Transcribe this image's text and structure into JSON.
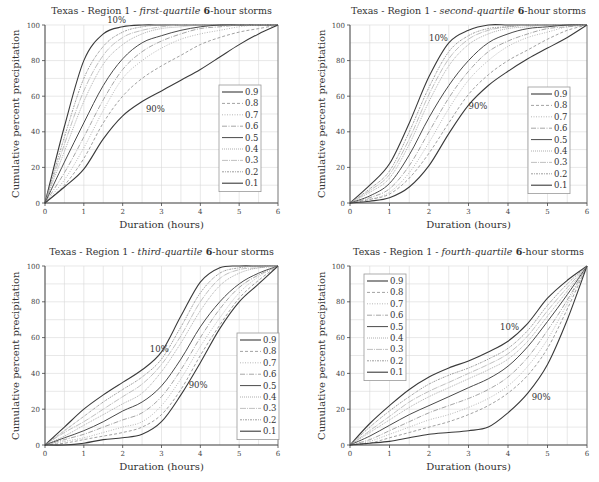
{
  "chart_data": [
    {
      "type": "line",
      "title_prefix": "Texas - Region 1 - ",
      "title_italic": "first-quartile",
      "title_bold": " 6",
      "title_suffix": "-hour storms",
      "xlabel": "Duration (hours)",
      "ylabel": "Cumulative percent precipitation",
      "xlim": [
        0,
        6
      ],
      "ylim": [
        0,
        100
      ],
      "xticks": [
        0,
        1,
        2,
        3,
        4,
        5,
        6
      ],
      "yticks": [
        0,
        20,
        40,
        60,
        80,
        100
      ],
      "grid": true,
      "legend_position": "right-middle",
      "legend": [
        "0.9",
        "0.8",
        "0.7",
        "0.6",
        "0.5",
        "0.4",
        "0.3",
        "0.2",
        "0.1"
      ],
      "annotations": [
        {
          "text": "10%",
          "x": 1.6,
          "y": 101
        },
        {
          "text": "90%",
          "x": 2.6,
          "y": 51
        }
      ],
      "x": [
        0,
        0.5,
        1,
        1.5,
        2,
        2.5,
        3,
        3.5,
        4,
        4.5,
        5,
        5.5,
        6
      ],
      "series": [
        {
          "name": "0.1",
          "values": [
            0,
            43,
            80,
            95,
            99,
            100,
            100,
            100,
            100,
            100,
            100,
            100,
            100
          ]
        },
        {
          "name": "0.2",
          "values": [
            0,
            37,
            70,
            88,
            96,
            99,
            100,
            100,
            100,
            100,
            100,
            100,
            100
          ]
        },
        {
          "name": "0.3",
          "values": [
            0,
            33,
            63,
            83,
            93,
            97,
            99,
            100,
            100,
            100,
            100,
            100,
            100
          ]
        },
        {
          "name": "0.4",
          "values": [
            0,
            29,
            57,
            78,
            89,
            95,
            98,
            99,
            100,
            100,
            100,
            100,
            100
          ]
        },
        {
          "name": "0.5",
          "values": [
            0,
            23,
            45,
            66,
            81,
            90,
            94,
            97,
            99,
            100,
            100,
            100,
            100
          ]
        },
        {
          "name": "0.6",
          "values": [
            0,
            17,
            37,
            58,
            75,
            85,
            91,
            95,
            98,
            99,
            100,
            100,
            100
          ]
        },
        {
          "name": "0.7",
          "values": [
            0,
            13,
            31,
            52,
            70,
            80,
            87,
            92,
            95,
            97,
            99,
            100,
            100
          ]
        },
        {
          "name": "0.8",
          "values": [
            0,
            10,
            25,
            45,
            60,
            70,
            77,
            83,
            89,
            93,
            96,
            98,
            100
          ]
        },
        {
          "name": "0.9",
          "values": [
            0,
            9,
            19,
            36,
            49,
            57,
            63,
            69,
            75,
            82,
            89,
            95,
            100
          ]
        }
      ]
    },
    {
      "type": "line",
      "title_prefix": "Texas - Region 1 - ",
      "title_italic": "second-quartile",
      "title_bold": " 6",
      "title_suffix": "-hour storms",
      "xlabel": "Duration (hours)",
      "ylabel": "Cumulative percent precipitation",
      "xlim": [
        0,
        6
      ],
      "ylim": [
        0,
        100
      ],
      "xticks": [
        0,
        1,
        2,
        3,
        4,
        5,
        6
      ],
      "yticks": [
        0,
        20,
        40,
        60,
        80,
        100
      ],
      "grid": true,
      "legend_position": "right-middle",
      "legend": [
        "0.9",
        "0.8",
        "0.7",
        "0.6",
        "0.5",
        "0.4",
        "0.3",
        "0.2",
        "0.1"
      ],
      "annotations": [
        {
          "text": "10%",
          "x": 2.0,
          "y": 91
        },
        {
          "text": "90%",
          "x": 3.0,
          "y": 53
        }
      ],
      "x": [
        0,
        0.5,
        1,
        1.5,
        2,
        2.5,
        3,
        3.5,
        4,
        4.5,
        5,
        5.5,
        6
      ],
      "series": [
        {
          "name": "0.1",
          "values": [
            0,
            10,
            22,
            45,
            71,
            90,
            97,
            100,
            100,
            100,
            100,
            100,
            100
          ]
        },
        {
          "name": "0.2",
          "values": [
            0,
            8,
            18,
            40,
            65,
            85,
            94,
            98,
            99,
            100,
            100,
            100,
            100
          ]
        },
        {
          "name": "0.3",
          "values": [
            0,
            7,
            16,
            36,
            61,
            81,
            92,
            97,
            99,
            100,
            100,
            100,
            100
          ]
        },
        {
          "name": "0.4",
          "values": [
            0,
            6,
            14,
            33,
            57,
            77,
            89,
            95,
            98,
            99,
            100,
            100,
            100
          ]
        },
        {
          "name": "0.5",
          "values": [
            0,
            4,
            11,
            27,
            48,
            66,
            80,
            90,
            95,
            98,
            99,
            100,
            100
          ]
        },
        {
          "name": "0.6",
          "values": [
            0,
            3,
            8,
            21,
            40,
            59,
            74,
            85,
            91,
            95,
            98,
            99,
            100
          ]
        },
        {
          "name": "0.7",
          "values": [
            0,
            2,
            6,
            17,
            34,
            53,
            69,
            80,
            88,
            93,
            96,
            99,
            100
          ]
        },
        {
          "name": "0.8",
          "values": [
            0,
            2,
            5,
            14,
            28,
            45,
            61,
            72,
            80,
            86,
            92,
            97,
            100
          ]
        },
        {
          "name": "0.9",
          "values": [
            0,
            1,
            3,
            9,
            21,
            39,
            55,
            66,
            74,
            81,
            87,
            93,
            100
          ]
        }
      ]
    },
    {
      "type": "line",
      "title_prefix": "Texas - Region 1 - ",
      "title_italic": "third-quartile",
      "title_bold": " 6",
      "title_suffix": "-hour storms",
      "xlabel": "Duration (hours)",
      "ylabel": "Cumulative percent precipitation",
      "xlim": [
        0,
        6
      ],
      "ylim": [
        0,
        100
      ],
      "xticks": [
        0,
        1,
        2,
        3,
        4,
        5,
        6
      ],
      "yticks": [
        0,
        20,
        40,
        60,
        80,
        100
      ],
      "grid": true,
      "legend_position": "right-middle",
      "legend": [
        "0.9",
        "0.8",
        "0.7",
        "0.6",
        "0.5",
        "0.4",
        "0.3",
        "0.2",
        "0.1"
      ],
      "annotations": [
        {
          "text": "10%",
          "x": 2.7,
          "y": 52
        },
        {
          "text": "90%",
          "x": 3.7,
          "y": 32
        }
      ],
      "x": [
        0,
        0.5,
        1,
        1.5,
        2,
        2.5,
        3,
        3.5,
        4,
        4.5,
        5,
        5.5,
        6
      ],
      "series": [
        {
          "name": "0.1",
          "values": [
            0,
            10,
            20,
            28,
            35,
            42,
            52,
            72,
            91,
            99,
            100,
            100,
            100
          ]
        },
        {
          "name": "0.2",
          "values": [
            0,
            8,
            16,
            24,
            31,
            38,
            48,
            66,
            85,
            96,
            99,
            100,
            100
          ]
        },
        {
          "name": "0.3",
          "values": [
            0,
            7,
            13,
            20,
            27,
            34,
            45,
            61,
            80,
            93,
            98,
            99,
            100
          ]
        },
        {
          "name": "0.4",
          "values": [
            0,
            5,
            11,
            17,
            23,
            29,
            41,
            57,
            75,
            89,
            96,
            99,
            100
          ]
        },
        {
          "name": "0.5",
          "values": [
            0,
            4,
            8,
            13,
            19,
            24,
            33,
            48,
            66,
            80,
            90,
            96,
            100
          ]
        },
        {
          "name": "0.6",
          "values": [
            0,
            3,
            6,
            10,
            14,
            18,
            27,
            42,
            60,
            76,
            88,
            95,
            100
          ]
        },
        {
          "name": "0.7",
          "values": [
            0,
            2,
            4,
            7,
            10,
            13,
            22,
            37,
            55,
            71,
            85,
            94,
            100
          ]
        },
        {
          "name": "0.8",
          "values": [
            0,
            1,
            3,
            5,
            7,
            10,
            17,
            31,
            50,
            67,
            82,
            92,
            100
          ]
        },
        {
          "name": "0.9",
          "values": [
            0,
            0,
            1,
            3,
            4,
            6,
            13,
            28,
            46,
            65,
            80,
            90,
            100
          ]
        }
      ]
    },
    {
      "type": "line",
      "title_prefix": "Texas - Region 1 - ",
      "title_italic": "fourth-quartile",
      "title_bold": " 6",
      "title_suffix": "-hour storms",
      "xlabel": "Duration (hours)",
      "ylabel": "Cumulative percent precipitation",
      "xlim": [
        0,
        6
      ],
      "ylim": [
        0,
        100
      ],
      "xticks": [
        0,
        1,
        2,
        3,
        4,
        5,
        6
      ],
      "yticks": [
        0,
        20,
        40,
        60,
        80,
        100
      ],
      "grid": true,
      "legend_position": "left-top",
      "legend": [
        "0.9",
        "0.8",
        "0.7",
        "0.6",
        "0.5",
        "0.4",
        "0.3",
        "0.2",
        "0.1"
      ],
      "annotations": [
        {
          "text": "10%",
          "x": 3.8,
          "y": 64
        },
        {
          "text": "90%",
          "x": 4.6,
          "y": 25
        }
      ],
      "x": [
        0,
        0.5,
        1,
        1.5,
        2,
        2.5,
        3,
        3.5,
        4,
        4.5,
        5,
        5.5,
        6
      ],
      "series": [
        {
          "name": "0.1",
          "values": [
            0,
            12,
            22,
            31,
            38,
            43,
            47,
            52,
            58,
            68,
            82,
            92,
            100
          ]
        },
        {
          "name": "0.2",
          "values": [
            0,
            10,
            19,
            27,
            34,
            39,
            43,
            48,
            54,
            64,
            78,
            90,
            100
          ]
        },
        {
          "name": "0.3",
          "values": [
            0,
            8,
            16,
            24,
            30,
            35,
            40,
            45,
            51,
            61,
            75,
            88,
            100
          ]
        },
        {
          "name": "0.4",
          "values": [
            0,
            7,
            14,
            21,
            27,
            32,
            37,
            42,
            48,
            58,
            72,
            86,
            100
          ]
        },
        {
          "name": "0.5",
          "values": [
            0,
            5,
            11,
            17,
            22,
            27,
            32,
            37,
            44,
            55,
            69,
            84,
            100
          ]
        },
        {
          "name": "0.6",
          "values": [
            0,
            3,
            8,
            13,
            18,
            22,
            26,
            31,
            38,
            49,
            64,
            81,
            100
          ]
        },
        {
          "name": "0.7",
          "values": [
            0,
            2,
            6,
            10,
            14,
            17,
            21,
            26,
            33,
            44,
            59,
            79,
            100
          ]
        },
        {
          "name": "0.8",
          "values": [
            0,
            1,
            4,
            7,
            10,
            13,
            17,
            22,
            29,
            39,
            54,
            76,
            100
          ]
        },
        {
          "name": "0.9",
          "values": [
            0,
            1,
            2,
            4,
            6,
            7,
            8,
            10,
            18,
            29,
            45,
            70,
            100
          ]
        }
      ]
    }
  ],
  "line_styles": {
    "0.9": {
      "color": "#3a3a3a",
      "dash": "",
      "width": 1.1
    },
    "0.8": {
      "color": "#8a8a8a",
      "dash": "3,2",
      "width": 0.8
    },
    "0.7": {
      "color": "#a5a5a5",
      "dash": "1,1.5",
      "width": 0.8
    },
    "0.6": {
      "color": "#8f8f8f",
      "dash": "5,1.5,1,1.5",
      "width": 0.8
    },
    "0.5": {
      "color": "#4a4a4a",
      "dash": "",
      "width": 1.0
    },
    "0.4": {
      "color": "#9a9a9a",
      "dash": "1,1",
      "width": 0.8
    },
    "0.3": {
      "color": "#b0b0b0",
      "dash": "6,1,1,1",
      "width": 0.8
    },
    "0.2": {
      "color": "#888888",
      "dash": "2,1,1,1",
      "width": 0.8
    },
    "0.1": {
      "color": "#3a3a3a",
      "dash": "",
      "width": 1.1
    }
  }
}
